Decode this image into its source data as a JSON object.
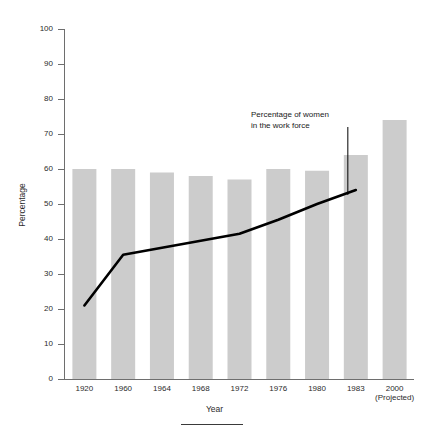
{
  "chart_data": {
    "type": "bar",
    "title": "",
    "xlabel": "Year",
    "ylabel": "Percentage",
    "ylim": [
      0,
      100
    ],
    "ytick_step": 10,
    "yticks": [
      0,
      10,
      20,
      30,
      40,
      50,
      60,
      70,
      80,
      90,
      100
    ],
    "grid": false,
    "legend": "none",
    "categories": [
      "1920",
      "1960",
      "1964",
      "1968",
      "1972",
      "1976",
      "1980",
      "1983",
      "2000"
    ],
    "category_sublabels": [
      "",
      "",
      "",
      "",
      "",
      "",
      "",
      "",
      "(Projected)"
    ],
    "series": [
      {
        "name": "bars",
        "type": "bar",
        "color": "#cccccc",
        "values": [
          60,
          60,
          59,
          58,
          57,
          60,
          59.5,
          64,
          74
        ]
      },
      {
        "name": "Percentage of women in the work force",
        "type": "line",
        "color": "#000000",
        "values": [
          21,
          35.5,
          37.5,
          39.5,
          41.5,
          45.5,
          50,
          54,
          null
        ]
      }
    ],
    "annotations": [
      {
        "id": "line-callout",
        "line1": "Percentage of women",
        "line2": "in the work force"
      }
    ]
  },
  "axes": {
    "y_title": "Percentage",
    "x_title": "Year",
    "y_tick_labels": [
      "100",
      "90",
      "80",
      "70",
      "60",
      "50",
      "40",
      "30",
      "20",
      "10",
      "0"
    ],
    "x_tick_labels": [
      "1920",
      "1960",
      "1964",
      "1968",
      "1972",
      "1976",
      "1980",
      "1983",
      "2000"
    ],
    "x_projected_note": "(Projected)"
  },
  "annotation": {
    "line1": "Percentage of women",
    "line2": "in the work force"
  },
  "header": {
    "title_remnant": ""
  },
  "colors": {
    "bar_fill": "#cccccc",
    "line": "#000000",
    "axis": "#6e6e6e",
    "text": "#2b2b2b",
    "background": "#ffffff"
  }
}
